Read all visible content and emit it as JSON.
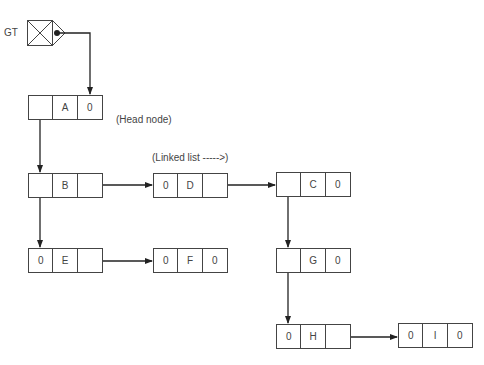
{
  "diagram": {
    "pointer_label": "GT",
    "annotations": {
      "head_node": "(Head node)",
      "linked_list": "(Linked list ----->)"
    },
    "nodes": [
      {
        "id": "A",
        "cells": [
          "",
          "A",
          "0"
        ],
        "x": 28,
        "y": 95
      },
      {
        "id": "B",
        "cells": [
          "",
          "B",
          ""
        ],
        "x": 28,
        "y": 173
      },
      {
        "id": "D",
        "cells": [
          "0",
          "D",
          ""
        ],
        "x": 153,
        "y": 173
      },
      {
        "id": "C",
        "cells": [
          "",
          "C",
          "0"
        ],
        "x": 276,
        "y": 172
      },
      {
        "id": "E",
        "cells": [
          "0",
          "E",
          ""
        ],
        "x": 28,
        "y": 248
      },
      {
        "id": "F",
        "cells": [
          "0",
          "F",
          "0"
        ],
        "x": 153,
        "y": 248
      },
      {
        "id": "G",
        "cells": [
          "",
          "G",
          "0"
        ],
        "x": 276,
        "y": 248
      },
      {
        "id": "H",
        "cells": [
          "0",
          "H",
          ""
        ],
        "x": 276,
        "y": 324
      },
      {
        "id": "I",
        "cells": [
          "0",
          "I",
          "0"
        ],
        "x": 398,
        "y": 323
      }
    ],
    "edges": [
      {
        "from": "GT",
        "to": "A"
      },
      {
        "from": "A",
        "to": "B"
      },
      {
        "from": "B",
        "to": "D"
      },
      {
        "from": "B",
        "to": "E"
      },
      {
        "from": "D",
        "to": "C"
      },
      {
        "from": "C",
        "to": "G"
      },
      {
        "from": "E",
        "to": "F"
      },
      {
        "from": "G",
        "to": "H"
      },
      {
        "from": "H",
        "to": "I"
      }
    ]
  }
}
